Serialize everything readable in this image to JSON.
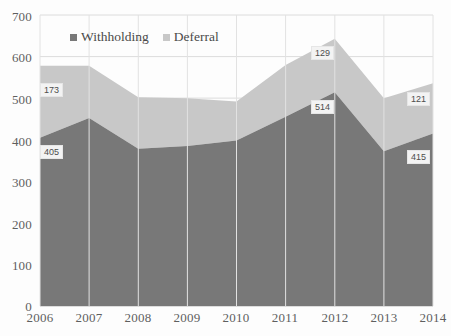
{
  "chart_data": {
    "type": "area",
    "stacked": true,
    "title": "",
    "xlabel": "",
    "ylabel": "",
    "categories": [
      "2006",
      "2007",
      "2008",
      "2009",
      "2010",
      "2011",
      "2012",
      "2013",
      "2014"
    ],
    "x": [
      2006,
      2007,
      2008,
      2009,
      2010,
      2011,
      2012,
      2013,
      2014
    ],
    "ylim": [
      0,
      700
    ],
    "ytick_values": [
      0,
      100,
      200,
      300,
      400,
      500,
      600,
      700
    ],
    "ytick_labels": [
      "0",
      "100",
      "200",
      "300",
      "400",
      "500",
      "600",
      "700"
    ],
    "grid": true,
    "grid_orientation": "both",
    "legend_position": "top-center",
    "series": [
      {
        "name": "Withholding",
        "color": "#787878",
        "values": [
          405,
          452,
          378,
          385,
          398,
          455,
          514,
          372,
          415
        ]
      },
      {
        "name": "Deferral",
        "color": "#c8c8c8",
        "values": [
          173,
          126,
          124,
          115,
          94,
          125,
          129,
          128,
          121
        ]
      }
    ],
    "totals": [
      578,
      578,
      502,
      500,
      492,
      580,
      643,
      500,
      536
    ],
    "annotations": [
      {
        "text": "173",
        "series": "Deferral",
        "category": "2006",
        "value": 173
      },
      {
        "text": "405",
        "series": "Withholding",
        "category": "2006",
        "value": 405
      },
      {
        "text": "129",
        "series": "Deferral",
        "category": "2012",
        "value": 129
      },
      {
        "text": "514",
        "series": "Withholding",
        "category": "2012",
        "value": 514
      },
      {
        "text": "121",
        "series": "Deferral",
        "category": "2014",
        "value": 121
      },
      {
        "text": "415",
        "series": "Withholding",
        "category": "2014",
        "value": 415
      }
    ]
  },
  "legend": {
    "items": [
      {
        "label": "Withholding",
        "color": "#787878"
      },
      {
        "label": "Deferral",
        "color": "#c8c8c8"
      }
    ]
  },
  "axes": {
    "y_labels": [
      "700",
      "600",
      "500",
      "400",
      "300",
      "200",
      "100",
      "0"
    ],
    "x_labels": [
      "2006",
      "2007",
      "2008",
      "2009",
      "2010",
      "2011",
      "2012",
      "2013",
      "2014"
    ]
  },
  "labels": {
    "a_173": "173",
    "a_405": "405",
    "a_129": "129",
    "a_514": "514",
    "a_121": "121",
    "a_415": "415"
  }
}
